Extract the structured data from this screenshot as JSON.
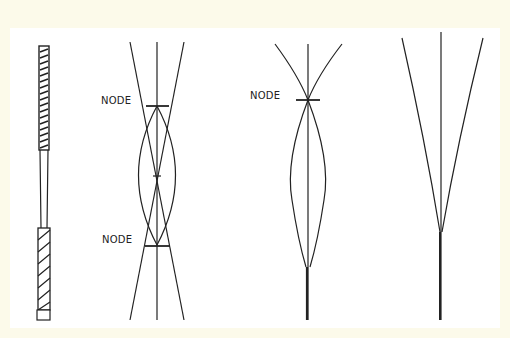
{
  "figure": {
    "labels": {
      "node_a_top": "NODE",
      "node_a_bottom": "NODE",
      "node_b_top": "NODE"
    },
    "colors": {
      "background": "#fcfaea",
      "panel": "#ffffff",
      "ink": "#222222"
    },
    "components": [
      "reed-rod",
      "two-node-vibration",
      "one-node-vibration",
      "fixed-end-vibration"
    ]
  }
}
